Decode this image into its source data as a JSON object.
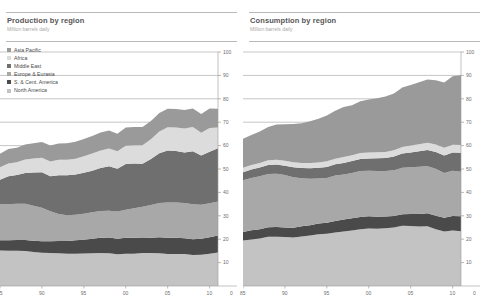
{
  "panels": [
    {
      "key": "production",
      "title": "Production by region",
      "subtitle": "Million barrels daily"
    },
    {
      "key": "consumption",
      "title": "Consumption by region",
      "subtitle": "Million barrels daily"
    }
  ],
  "legend": {
    "items": [
      {
        "label": "Asia Pacific",
        "color": "#9a9a9a"
      },
      {
        "label": "Africa",
        "color": "#dcdcdc"
      },
      {
        "label": "Middle East",
        "color": "#6f6f6f"
      },
      {
        "label": "Europe & Eurasia",
        "color": "#a8a8a8"
      },
      {
        "label": "S. & Cent. America",
        "color": "#4a4a4a"
      },
      {
        "label": "North America",
        "color": "#c3c3c3"
      }
    ]
  },
  "axis": {
    "y_ticks": [
      10,
      20,
      30,
      40,
      50,
      60,
      70,
      80,
      90,
      100
    ],
    "y_min": 0,
    "y_max": 100,
    "x_ticks": [
      "85",
      "90",
      "95",
      "00",
      "05",
      "10"
    ],
    "x_tick_years": [
      1985,
      1990,
      1995,
      2000,
      2005,
      2010
    ],
    "x_min": 1985,
    "x_max": 2011,
    "x_end_label": "0",
    "grid": true,
    "legend_position": "top-left"
  },
  "chart_data": [
    {
      "type": "area",
      "stacked": true,
      "key": "production",
      "title": "Production by region",
      "subtitle": "Million barrels daily",
      "xlabel": "",
      "ylabel": "Million barrels daily",
      "ylim": [
        0,
        100
      ],
      "xlim": [
        1985,
        2011
      ],
      "x": [
        1985,
        1986,
        1987,
        1988,
        1989,
        1990,
        1991,
        1992,
        1993,
        1994,
        1995,
        1996,
        1997,
        1998,
        1999,
        2000,
        2001,
        2002,
        2003,
        2004,
        2005,
        2006,
        2007,
        2008,
        2009,
        2010,
        2011
      ],
      "stack_order_bottom_to_top": [
        "North America",
        "S. & Cent. America",
        "Europe & Eurasia",
        "Middle East",
        "Africa",
        "Asia Pacific"
      ],
      "series": [
        {
          "name": "North America",
          "values": [
            15.2,
            15.1,
            15.1,
            15.0,
            14.5,
            14.2,
            14.1,
            14.0,
            13.8,
            13.8,
            13.9,
            14.0,
            14.1,
            14.0,
            13.6,
            13.8,
            13.8,
            14.1,
            14.1,
            14.0,
            13.7,
            13.7,
            13.7,
            13.3,
            13.4,
            13.8,
            14.3
          ]
        },
        {
          "name": "S. & Cent. America",
          "values": [
            4.4,
            4.5,
            4.6,
            4.7,
            4.8,
            4.9,
            5.0,
            5.2,
            5.4,
            5.7,
            5.9,
            6.2,
            6.5,
            6.7,
            6.6,
            6.8,
            6.8,
            6.6,
            6.5,
            6.8,
            6.9,
            6.9,
            6.7,
            6.7,
            6.8,
            7.0,
            7.3
          ]
        },
        {
          "name": "Europe & Eurasia",
          "values": [
            15.3,
            15.3,
            15.4,
            15.4,
            15.0,
            14.3,
            12.8,
            11.6,
            11.0,
            10.9,
            11.1,
            11.3,
            11.5,
            11.5,
            11.6,
            12.0,
            12.6,
            13.2,
            14.0,
            14.7,
            15.1,
            15.1,
            15.1,
            14.9,
            14.5,
            14.6,
            14.5
          ]
        },
        {
          "name": "Middle East",
          "values": [
            10.5,
            12.0,
            12.3,
            13.2,
            14.2,
            15.2,
            15.0,
            16.5,
            17.1,
            17.2,
            17.5,
            17.8,
            18.3,
            19.0,
            18.3,
            19.5,
            19.2,
            18.3,
            19.7,
            21.2,
            22.2,
            22.0,
            21.5,
            22.7,
            21.1,
            22.0,
            22.8
          ]
        },
        {
          "name": "Africa",
          "values": [
            5.4,
            5.5,
            5.5,
            5.8,
            6.0,
            6.2,
            6.3,
            6.6,
            6.6,
            6.8,
            7.0,
            7.3,
            7.5,
            7.6,
            7.5,
            7.8,
            7.8,
            8.0,
            8.4,
            9.3,
            9.9,
            10.0,
            10.3,
            10.3,
            9.7,
            10.1,
            8.8
          ]
        },
        {
          "name": "Asia Pacific",
          "values": [
            5.7,
            6.1,
            6.2,
            6.4,
            6.5,
            6.7,
            6.8,
            7.0,
            7.1,
            7.2,
            7.4,
            7.5,
            7.7,
            7.6,
            7.5,
            7.8,
            7.8,
            7.8,
            7.8,
            7.9,
            7.9,
            7.9,
            7.9,
            8.0,
            8.0,
            8.4,
            8.1
          ]
        }
      ]
    },
    {
      "type": "area",
      "stacked": true,
      "key": "consumption",
      "title": "Consumption by region",
      "subtitle": "Million barrels daily",
      "xlabel": "",
      "ylabel": "Million barrels daily",
      "ylim": [
        0,
        100
      ],
      "xlim": [
        1985,
        2011
      ],
      "x": [
        1985,
        1986,
        1987,
        1988,
        1989,
        1990,
        1991,
        1992,
        1993,
        1994,
        1995,
        1996,
        1997,
        1998,
        1999,
        2000,
        2001,
        2002,
        2003,
        2004,
        2005,
        2006,
        2007,
        2008,
        2009,
        2010,
        2011
      ],
      "stack_order_bottom_to_top": [
        "North America",
        "S. & Cent. America",
        "Europe & Eurasia",
        "Middle East",
        "Africa",
        "Asia Pacific"
      ],
      "series": [
        {
          "name": "North America",
          "values": [
            19.4,
            19.9,
            20.3,
            21.0,
            21.1,
            20.9,
            20.7,
            21.2,
            21.6,
            22.1,
            22.3,
            22.9,
            23.3,
            23.7,
            24.3,
            24.6,
            24.5,
            24.7,
            25.0,
            25.7,
            25.6,
            25.4,
            25.5,
            24.2,
            23.3,
            23.7,
            23.4
          ]
        },
        {
          "name": "S. & Cent. America",
          "values": [
            3.7,
            3.9,
            4.0,
            4.1,
            4.1,
            4.1,
            4.2,
            4.3,
            4.4,
            4.6,
            4.7,
            4.9,
            5.1,
            5.2,
            5.2,
            5.2,
            5.1,
            5.0,
            4.9,
            5.0,
            5.2,
            5.4,
            5.6,
            5.8,
            5.9,
            6.2,
            6.4
          ]
        },
        {
          "name": "Europe & Eurasia",
          "values": [
            22.1,
            22.4,
            22.6,
            22.8,
            22.8,
            22.4,
            21.6,
            20.5,
            19.8,
            19.2,
            19.2,
            19.4,
            19.3,
            19.4,
            19.6,
            19.4,
            19.5,
            19.4,
            19.6,
            19.8,
            20.0,
            20.2,
            20.1,
            20.1,
            19.1,
            19.3,
            19.0
          ]
        },
        {
          "name": "Middle East",
          "values": [
            3.4,
            3.6,
            3.7,
            3.8,
            3.9,
            4.0,
            4.2,
            4.4,
            4.5,
            4.6,
            4.7,
            4.8,
            4.9,
            5.1,
            5.2,
            5.3,
            5.5,
            5.6,
            5.8,
            6.1,
            6.3,
            6.6,
            6.9,
            7.2,
            7.5,
            7.8,
            8.1
          ]
        },
        {
          "name": "Africa",
          "values": [
            1.9,
            1.9,
            2.0,
            2.0,
            2.1,
            2.1,
            2.2,
            2.2,
            2.3,
            2.3,
            2.4,
            2.4,
            2.5,
            2.5,
            2.5,
            2.5,
            2.6,
            2.6,
            2.7,
            2.8,
            2.9,
            3.0,
            3.1,
            3.2,
            3.3,
            3.4,
            3.4
          ]
        },
        {
          "name": "Asia Pacific",
          "values": [
            12.4,
            12.8,
            13.4,
            14.2,
            15.0,
            15.6,
            16.3,
            17.0,
            17.8,
            18.7,
            19.6,
            20.5,
            21.4,
            21.3,
            22.1,
            22.7,
            23.0,
            23.7,
            24.3,
            25.4,
            25.9,
            26.5,
            27.1,
            27.4,
            27.9,
            29.2,
            29.8
          ]
        }
      ]
    }
  ]
}
